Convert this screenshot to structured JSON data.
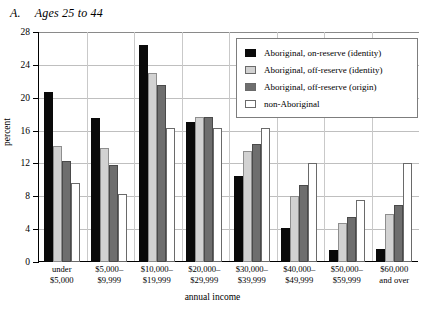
{
  "panel": {
    "letter": "A.",
    "title": "Ages 25 to 44"
  },
  "legend": {
    "position": "top-right-inside",
    "entries": [
      {
        "label": "Aboriginal, on-reserve (identity)",
        "color": "#0a0a0a",
        "swatch": "solid-black"
      },
      {
        "label": "Aboriginal, off-reserve (identity)",
        "color": "#d2d2d2",
        "swatch": "light-gray"
      },
      {
        "label": "Aboriginal, off-reserve (origin)",
        "color": "#6e6e6e",
        "swatch": "dark-gray"
      },
      {
        "label": "non-Aboriginal",
        "color": "#ffffff",
        "swatch": "white-outline"
      }
    ]
  },
  "chart_data": {
    "type": "bar",
    "title": "Ages 25 to 44",
    "xlabel": "annual income",
    "ylabel": "percent",
    "ylim": [
      0,
      28
    ],
    "yticks": [
      0,
      4,
      8,
      12,
      16,
      20,
      24,
      28
    ],
    "grid": true,
    "categories": [
      "under\n$5,000",
      "$5,000–\n$9,999",
      "$10,000–\n$19,999",
      "$20,000–\n$29,999",
      "$30,000–\n$39,999",
      "$40,000–\n$49,999",
      "$50,000–\n$59,999",
      "$60,000\nand over"
    ],
    "category_lines": [
      [
        "under",
        "$5,000"
      ],
      [
        "$5,000–",
        "$9,999"
      ],
      [
        "$10,000–",
        "$19,999"
      ],
      [
        "$20,000–",
        "$29,999"
      ],
      [
        "$30,000–",
        "$39,999"
      ],
      [
        "$40,000–",
        "$49,999"
      ],
      [
        "$50,000–",
        "$59,999"
      ],
      [
        "$60,000",
        "and over"
      ]
    ],
    "series": [
      {
        "name": "Aboriginal, on-reserve (identity)",
        "color": "#0a0a0a",
        "values": [
          20.7,
          17.5,
          26.4,
          17.1,
          10.5,
          4.1,
          1.5,
          1.6
        ]
      },
      {
        "name": "Aboriginal, off-reserve (identity)",
        "color": "#d2d2d2",
        "values": [
          14.1,
          13.9,
          23.0,
          17.6,
          13.5,
          8.0,
          4.7,
          5.8
        ]
      },
      {
        "name": "Aboriginal, off-reserve (origin)",
        "color": "#6e6e6e",
        "values": [
          12.3,
          11.8,
          21.5,
          17.6,
          14.4,
          9.4,
          5.5,
          7.0
        ]
      },
      {
        "name": "non-Aboriginal",
        "color": "#ffffff",
        "values": [
          9.6,
          8.3,
          16.3,
          16.3,
          16.3,
          12.0,
          7.5,
          12.0
        ]
      }
    ]
  }
}
